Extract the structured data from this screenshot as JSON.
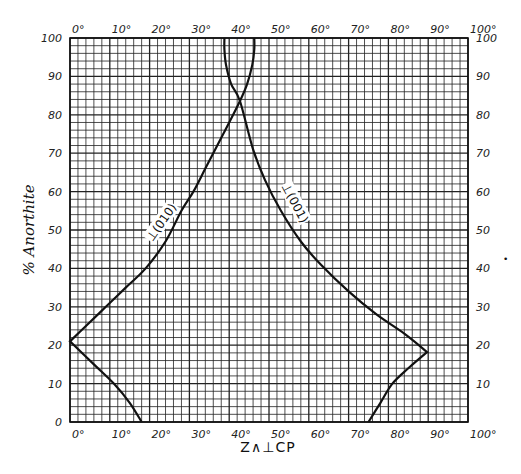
{
  "chart_data": {
    "type": "line",
    "title": "",
    "xlabel": "Z∧⊥CP",
    "ylabel": "% Anorthite",
    "xlim": [
      0,
      100
    ],
    "ylim": [
      0,
      100
    ],
    "grid": true,
    "grid_minor_step": 2,
    "grid_major_step": 10,
    "x_ticks": [
      "0°",
      "10°",
      "20°",
      "30°",
      "40°",
      "50°",
      "60°",
      "70°",
      "80°",
      "90°",
      "100°"
    ],
    "y_ticks": [
      "0",
      "10",
      "20",
      "30",
      "40",
      "50",
      "60",
      "70",
      "80",
      "90",
      "100"
    ],
    "x_ticks_top": [
      "0°",
      "10°",
      "20°",
      "30°",
      "40°",
      "50°",
      "60°",
      "70°",
      "80°",
      "90°",
      "100°"
    ],
    "y_ticks_right": [
      "10",
      "20",
      "30",
      "40",
      "50",
      "60",
      "70",
      "80",
      "90",
      "100"
    ],
    "legend": null,
    "series": [
      {
        "name": "⊥(010)",
        "label_text": "⊥(010)",
        "label_position": {
          "x": 23,
          "y": 52,
          "rotate": -55
        },
        "x": [
          18,
          15,
          11,
          6,
          0,
          4,
          9,
          14,
          19,
          24,
          28,
          31,
          34,
          37,
          40,
          42.7,
          44.5,
          45.8,
          46.3,
          46.3
        ],
        "y": [
          0,
          5,
          10,
          15,
          21,
          25,
          30,
          35,
          40,
          47,
          55,
          60,
          66,
          72,
          78,
          83.6,
          88,
          93,
          97,
          100
        ]
      },
      {
        "name": "⊥(001)",
        "label_text": "⊥(001)",
        "label_position": {
          "x": 56.5,
          "y": 57,
          "rotate": 62
        },
        "x": [
          75,
          78,
          81,
          85,
          89.7,
          84,
          77,
          70,
          63,
          58,
          53,
          49,
          46,
          42.7,
          40.5,
          39.2,
          38.8,
          38.8
        ],
        "y": [
          0,
          5,
          10,
          14,
          18.2,
          23,
          28,
          34,
          41,
          47,
          55,
          63,
          71,
          83.6,
          88,
          93,
          97,
          100
        ]
      }
    ],
    "annotations": [
      {
        "text": "curves cross",
        "x": 42.7,
        "y": 83.6
      }
    ]
  }
}
